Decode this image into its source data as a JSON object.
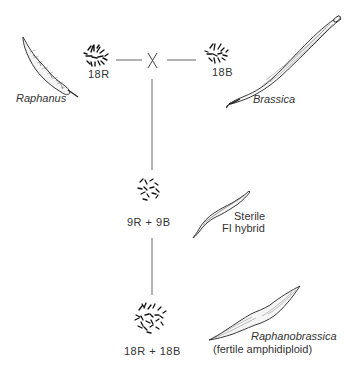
{
  "diagram": {
    "parents": {
      "radish": {
        "name": "Raphanus",
        "chromosomes": "18R"
      },
      "cabbage": {
        "name": "Brassica",
        "chromosomes": "18B"
      },
      "cross_symbol": "X"
    },
    "hybrid": {
      "chromosomes": "9R + 9B",
      "label_line1": "Sterile",
      "label_line2": "FI hybrid"
    },
    "amphidiploid": {
      "chromosomes": "18R + 18B",
      "name": "Raphanobrassica",
      "note": "(fertile amphidiploid)"
    },
    "colors": {
      "line": "#555555",
      "ink": "#222222",
      "background": "#ffffff"
    }
  }
}
